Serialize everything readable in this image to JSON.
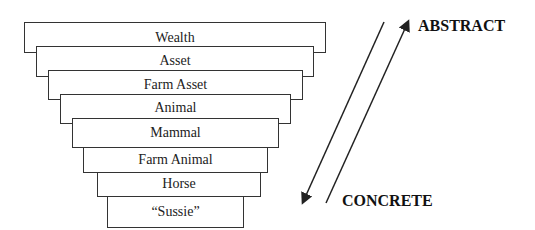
{
  "diagram": {
    "levels": [
      {
        "label": "Wealth",
        "x": 24,
        "y": 22,
        "w": 302,
        "h": 31,
        "ty": 29
      },
      {
        "label": "Asset",
        "x": 36,
        "y": 46,
        "w": 278,
        "h": 31,
        "ty": 52
      },
      {
        "label": "Farm Asset",
        "x": 48,
        "y": 70,
        "w": 255,
        "h": 30,
        "ty": 76
      },
      {
        "label": "Animal",
        "x": 60,
        "y": 94,
        "w": 231,
        "h": 30,
        "ty": 99
      },
      {
        "label": "Mammal",
        "x": 72,
        "y": 118,
        "w": 207,
        "h": 30,
        "ty": 124
      },
      {
        "label": "Farm Animal",
        "x": 83,
        "y": 147,
        "w": 185,
        "h": 26,
        "ty": 151
      },
      {
        "label": "Horse",
        "x": 97,
        "y": 172,
        "w": 164,
        "h": 25,
        "ty": 175
      },
      {
        "label": "“Sussie”",
        "x": 107,
        "y": 196,
        "w": 137,
        "h": 32,
        "ty": 203
      }
    ],
    "abstract_label": "ABSTRACT",
    "concrete_label": "CONCRETE",
    "arrow_down": {
      "x1": 384,
      "y1": 22,
      "x2": 303,
      "y2": 202
    },
    "arrow_up": {
      "x1": 326,
      "y1": 203,
      "x2": 408,
      "y2": 22
    },
    "line_color": "#222222"
  }
}
